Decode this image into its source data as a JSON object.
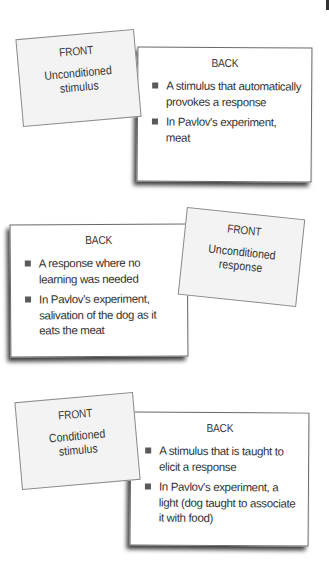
{
  "cards": [
    {
      "front": {
        "heading": "FRONT",
        "term": "Unconditioned stimulus"
      },
      "back": {
        "heading": "BACK",
        "bullets": [
          "A stimulus that automatically provokes a response",
          "In Pavlov's experiment, meat"
        ]
      }
    },
    {
      "front": {
        "heading": "FRONT",
        "term": "Unconditioned response"
      },
      "back": {
        "heading": "BACK",
        "bullets": [
          "A response where no learning was needed",
          "In Pavlov's experiment, salivation of the dog as it eats the meat"
        ]
      }
    },
    {
      "front": {
        "heading": "FRONT",
        "term": "Conditioned stimulus"
      },
      "back": {
        "heading": "BACK",
        "bullets": [
          "A stimulus that is taught to elicit a response",
          "In Pavlov's experiment, a light (dog taught to associate it with food)"
        ]
      }
    }
  ],
  "colors": {
    "front_fill": "#f3f3f3",
    "back_fill": "#ffffff",
    "border": "#6a6a6a",
    "bullet": "#5a5a5a",
    "text": "#333333"
  }
}
